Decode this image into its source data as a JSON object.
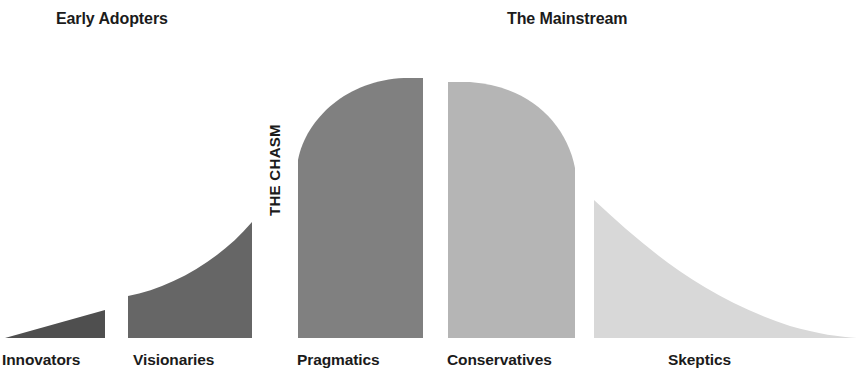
{
  "headers": [
    {
      "id": "early",
      "label": "Early Adopters"
    },
    {
      "id": "mainstream",
      "label": "The Mainstream"
    }
  ],
  "chasm": {
    "label": "THE CHASM"
  },
  "categories": [
    {
      "id": "innovators",
      "label": "Innovators"
    },
    {
      "id": "visionaries",
      "label": "Visionaries"
    },
    {
      "id": "pragmatics",
      "label": "Pragmatics"
    },
    {
      "id": "conservatives",
      "label": "Conservatives"
    },
    {
      "id": "skeptics",
      "label": "Skeptics"
    }
  ],
  "colors": {
    "background": "#ffffff",
    "text": "#1b1b1b",
    "innovators": "#4f4f4f",
    "visionaries": "#666666",
    "pragmatics": "#808080",
    "conservatives": "#b5b5b5",
    "skeptics": "#d8d8d8"
  },
  "chart_data": {
    "type": "area",
    "xlabel": "",
    "ylabel": "",
    "grid": false,
    "legend_position": "none",
    "baseline_y": 338,
    "xlim": [
      0,
      857
    ],
    "ylim": [
      0,
      345
    ],
    "annotations": [
      {
        "text": "Early Adopters",
        "x": 120,
        "y": 19
      },
      {
        "text": "The Mainstream",
        "x": 580,
        "y": 19
      },
      {
        "text": "THE CHASM",
        "x": 275,
        "y": 265,
        "rotation": -90
      }
    ],
    "categories": [
      "Innovators",
      "Visionaries",
      "Pragmatics",
      "Conservatives",
      "Skeptics"
    ],
    "values": [
      28,
      116,
      260,
      256,
      138
    ],
    "series": [
      {
        "name": "Adoption Curve",
        "segments": [
          {
            "name": "Innovators",
            "color": "#4f4f4f",
            "x_start": 5,
            "x_end": 105,
            "peak_height": 28,
            "shape": "wedge",
            "path": "M 5 338 L 105 310 L 105 338 Z"
          },
          {
            "name": "Visionaries",
            "color": "#666666",
            "x_start": 128,
            "x_end": 252,
            "peak_height": 116,
            "shape": "concave-rise",
            "path": "M 128 338 L 128 296 C 170 288 218 262 252 222 L 252 338 Z"
          },
          {
            "name": "Pragmatics",
            "color": "#808080",
            "x_start": 298,
            "x_end": 423,
            "peak_height": 260,
            "shape": "shoulder-left",
            "path": "M 298 338 L 298 160 C 306 118 348 80 404 78 L 423 78 L 423 338 Z"
          },
          {
            "name": "Conservatives",
            "color": "#b5b5b5",
            "x_start": 448,
            "x_end": 575,
            "peak_height": 256,
            "shape": "shoulder-right",
            "path": "M 448 338 L 448 82 L 470 82 C 528 86 566 122 575 168 L 575 338 Z"
          },
          {
            "name": "Skeptics",
            "color": "#d8d8d8",
            "x_start": 594,
            "x_end": 857,
            "peak_height": 138,
            "shape": "decaying-tail",
            "path": "M 594 338 L 594 200 C 646 248 700 296 790 326 C 818 334 840 337 857 338 Z"
          }
        ]
      }
    ]
  }
}
